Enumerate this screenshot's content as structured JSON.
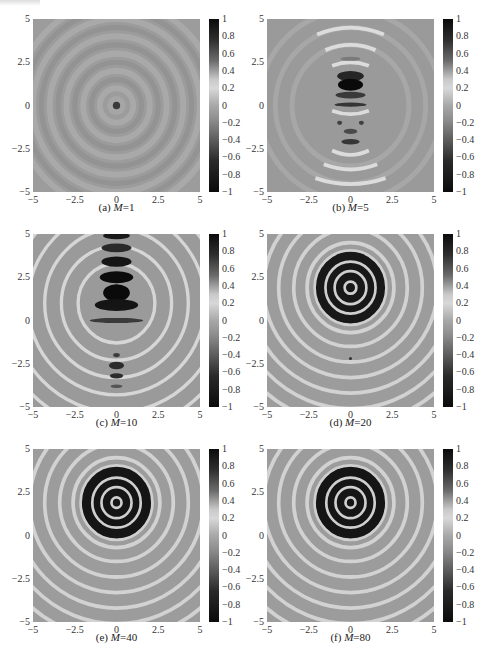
{
  "chart_data": [
    {
      "panel": "a",
      "caption_prefix": "(a)",
      "caption_var": "M",
      "caption_val": "=1",
      "M": 1,
      "type": "heatmap",
      "title": "(a) M=1",
      "xlim": [
        -5,
        5
      ],
      "ylim": [
        -5,
        5
      ],
      "clim": [
        -1,
        1
      ],
      "xticks": [
        "−5",
        "−2.5",
        "0",
        "2.5",
        "5"
      ],
      "yticks": [
        "5",
        "2.5",
        "0",
        "−2.5",
        "−5"
      ],
      "colorbar_ticks": [
        "1",
        "0.8",
        "0.6",
        "0.4",
        "0.2",
        "0",
        "−0.2",
        "−0.4",
        "−0.6",
        "−0.8",
        "−1"
      ],
      "description": "faint concentric rings centered at (0,0), small dark spot at center"
    },
    {
      "panel": "b",
      "caption_prefix": "(b)",
      "caption_var": "M",
      "caption_val": "=5",
      "M": 5,
      "type": "heatmap",
      "title": "(b) M=5",
      "xlim": [
        -5,
        5
      ],
      "ylim": [
        -5,
        5
      ],
      "clim": [
        -1,
        1
      ],
      "xticks": [
        "−5",
        "−2.5",
        "0",
        "2.5",
        "5"
      ],
      "yticks": [
        "5",
        "2.5",
        "0",
        "−2.5",
        "−5"
      ],
      "colorbar_ticks": [
        "1",
        "0.8",
        "0.6",
        "0.4",
        "0.2",
        "0",
        "−0.2",
        "−0.4",
        "−0.6",
        "−0.8",
        "−1"
      ],
      "description": "vertical lobe pattern, strongest dark lobe near (0,1.2)"
    },
    {
      "panel": "c",
      "caption_prefix": "(c)",
      "caption_var": "M",
      "caption_val": "=10",
      "M": 10,
      "type": "heatmap",
      "title": "(c) M=10",
      "xlim": [
        -5,
        5
      ],
      "ylim": [
        -5,
        5
      ],
      "clim": [
        -1,
        1
      ],
      "xticks": [
        "−5",
        "−2.5",
        "0",
        "2.5",
        "5"
      ],
      "yticks": [
        "5",
        "2.5",
        "0",
        "−2.5",
        "−5"
      ],
      "colorbar_ticks": [
        "1",
        "0.8",
        "0.6",
        "0.4",
        "0.2",
        "0",
        "−0.2",
        "−0.4",
        "−0.6",
        "−0.8",
        "−1"
      ],
      "description": "dark lobes stacked above center near (0,1.5)-(0,5), secondary lobes near (0,-2.5)"
    },
    {
      "panel": "d",
      "caption_prefix": "(d)",
      "caption_var": "M",
      "caption_val": "=20",
      "M": 20,
      "type": "heatmap",
      "title": "(d) M=20",
      "xlim": [
        -5,
        5
      ],
      "ylim": [
        -5,
        5
      ],
      "clim": [
        -1,
        1
      ],
      "xticks": [
        "−5",
        "−2.5",
        "0",
        "2.5",
        "5"
      ],
      "yticks": [
        "5",
        "2.5",
        "0",
        "−2.5",
        "−5"
      ],
      "colorbar_ticks": [
        "1",
        "0.8",
        "0.6",
        "0.4",
        "0.2",
        "0",
        "−0.2",
        "−0.4",
        "−0.6",
        "−0.8",
        "−1"
      ],
      "description": "concentric rings focused at (0,2)"
    },
    {
      "panel": "e",
      "caption_prefix": "(e)",
      "caption_var": "M",
      "caption_val": "=40",
      "M": 40,
      "type": "heatmap",
      "title": "(e) M=40",
      "xlim": [
        -5,
        5
      ],
      "ylim": [
        -5,
        5
      ],
      "clim": [
        -1,
        1
      ],
      "xticks": [
        "−5",
        "−2.5",
        "0",
        "2.5",
        "5"
      ],
      "yticks": [
        "5",
        "2.5",
        "0",
        "−2.5",
        "−5"
      ],
      "colorbar_ticks": [
        "1",
        "0.8",
        "0.6",
        "0.4",
        "0.2",
        "0",
        "−0.2",
        "−0.4",
        "−0.6",
        "−0.8",
        "−1"
      ],
      "description": "concentric rings focused at (0,2)"
    },
    {
      "panel": "f",
      "caption_prefix": "(f)",
      "caption_var": "M",
      "caption_val": "=80",
      "M": 80,
      "type": "heatmap",
      "title": "(f) M=80",
      "xlim": [
        -5,
        5
      ],
      "ylim": [
        -5,
        5
      ],
      "clim": [
        -1,
        1
      ],
      "xticks": [
        "−5",
        "−2.5",
        "0",
        "2.5",
        "5"
      ],
      "yticks": [
        "5",
        "2.5",
        "0",
        "−2.5",
        "−5"
      ],
      "colorbar_ticks": [
        "1",
        "0.8",
        "0.6",
        "0.4",
        "0.2",
        "0",
        "−0.2",
        "−0.4",
        "−0.6",
        "−0.8",
        "−1"
      ],
      "description": "concentric rings focused at (0,2)"
    }
  ]
}
